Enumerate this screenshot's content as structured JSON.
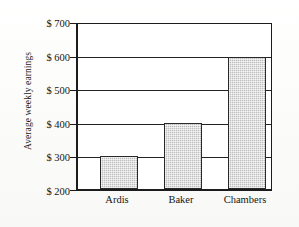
{
  "chart_data": {
    "type": "bar",
    "title": "",
    "xlabel": "",
    "ylabel": "Average weekly earnings",
    "categories": [
      "Ardis",
      "Baker",
      "Chambers"
    ],
    "values": [
      300,
      400,
      600
    ],
    "value_prefix": "$",
    "ylim": [
      200,
      700
    ],
    "ytick_values": [
      200,
      300,
      400,
      500,
      600,
      700
    ],
    "ytick_labels": [
      "$ 200",
      "$ 300",
      "$ 400",
      "$ 500",
      "$ 600",
      "$ 700"
    ],
    "grid": true,
    "legend": "none",
    "series": [
      {
        "name": "Average weekly earnings",
        "values": [
          300,
          400,
          600
        ]
      }
    ],
    "colors": {
      "bar_fill": "#bcbcbc",
      "bar_border": "#2a2a2a",
      "axis": "#1c1c1c",
      "gridline": "#222222",
      "plot_background": "#ffffff",
      "page_background": "#fdfdfb",
      "text": "#151515"
    }
  },
  "axis": {
    "y_title": "Average weekly earnings"
  }
}
